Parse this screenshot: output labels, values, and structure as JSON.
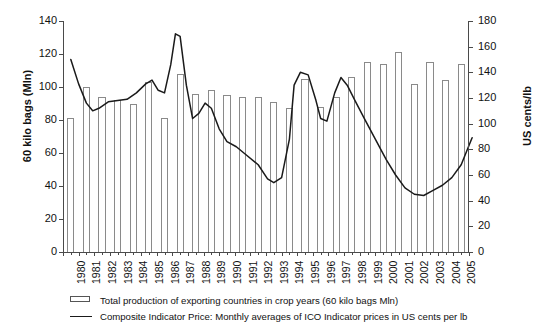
{
  "chart_data": {
    "type": "bar",
    "title": "",
    "xlabel": "",
    "ylabel": "60 kilo bags (Mln)",
    "ylabel_right": "US cents/lb",
    "ylim": [
      0,
      140
    ],
    "ylim_right": [
      0,
      180
    ],
    "yticks": [
      0,
      20,
      40,
      60,
      80,
      100,
      120,
      140
    ],
    "yticks_right": [
      0,
      20,
      40,
      60,
      80,
      100,
      120,
      140,
      160,
      180
    ],
    "grid": false,
    "legend_position": "bottom",
    "categories": [
      "1980",
      "1981",
      "1982",
      "1983",
      "1984",
      "1985",
      "1986",
      "1987",
      "1988",
      "1989",
      "1990",
      "1991",
      "1992",
      "1993",
      "1994",
      "1995",
      "1996",
      "1997",
      "1998",
      "1999",
      "2000",
      "2001",
      "2002",
      "2003",
      "2004",
      "2005"
    ],
    "series": [
      {
        "name": "Total production of exporting countries in crop years (60 kilo bags Mln)",
        "type": "bar",
        "axis": "left",
        "unit": "60 kilo bags Mln",
        "values": [
          81,
          100,
          94,
          92,
          90,
          103,
          81,
          108,
          96,
          98,
          95,
          94,
          94,
          91,
          87,
          105,
          88,
          94,
          106,
          115,
          114,
          121,
          102,
          115,
          104,
          114
        ]
      },
      {
        "name": "Composite Indicator Price: Monthly averages of ICO Indicator prices in US cents per lb",
        "type": "line",
        "axis": "right",
        "unit": "US cents/lb",
        "values": [
          150,
          115,
          112,
          118,
          125,
          131,
          170,
          102,
          110,
          106,
          84,
          76,
          54,
          62,
          137,
          136,
          104,
          133,
          109,
          86,
          64,
          46,
          44,
          51,
          62,
          89
        ]
      }
    ],
    "line_points_right_axis": [
      {
        "x": 1980.0,
        "y": 150
      },
      {
        "x": 1980.5,
        "y": 131
      },
      {
        "x": 1981.0,
        "y": 116
      },
      {
        "x": 1981.4,
        "y": 110
      },
      {
        "x": 1981.8,
        "y": 112
      },
      {
        "x": 1982.4,
        "y": 117
      },
      {
        "x": 1983.0,
        "y": 118
      },
      {
        "x": 1983.6,
        "y": 119
      },
      {
        "x": 1984.2,
        "y": 124
      },
      {
        "x": 1984.8,
        "y": 131
      },
      {
        "x": 1985.2,
        "y": 134
      },
      {
        "x": 1985.6,
        "y": 126
      },
      {
        "x": 1986.0,
        "y": 124
      },
      {
        "x": 1986.4,
        "y": 146
      },
      {
        "x": 1986.7,
        "y": 170
      },
      {
        "x": 1987.0,
        "y": 168
      },
      {
        "x": 1987.4,
        "y": 130
      },
      {
        "x": 1987.8,
        "y": 104
      },
      {
        "x": 1988.2,
        "y": 108
      },
      {
        "x": 1988.6,
        "y": 116
      },
      {
        "x": 1989.0,
        "y": 112
      },
      {
        "x": 1989.5,
        "y": 96
      },
      {
        "x": 1990.0,
        "y": 86
      },
      {
        "x": 1990.6,
        "y": 82
      },
      {
        "x": 1991.2,
        "y": 76
      },
      {
        "x": 1992.0,
        "y": 68
      },
      {
        "x": 1992.6,
        "y": 57
      },
      {
        "x": 1993.0,
        "y": 54
      },
      {
        "x": 1993.5,
        "y": 58
      },
      {
        "x": 1994.0,
        "y": 88
      },
      {
        "x": 1994.3,
        "y": 130
      },
      {
        "x": 1994.7,
        "y": 140
      },
      {
        "x": 1995.2,
        "y": 138
      },
      {
        "x": 1995.7,
        "y": 118
      },
      {
        "x": 1996.0,
        "y": 104
      },
      {
        "x": 1996.4,
        "y": 102
      },
      {
        "x": 1996.9,
        "y": 124
      },
      {
        "x": 1997.3,
        "y": 136
      },
      {
        "x": 1997.7,
        "y": 130
      },
      {
        "x": 1998.2,
        "y": 118
      },
      {
        "x": 1998.8,
        "y": 104
      },
      {
        "x": 1999.5,
        "y": 88
      },
      {
        "x": 2000.2,
        "y": 72
      },
      {
        "x": 2000.8,
        "y": 60
      },
      {
        "x": 2001.4,
        "y": 50
      },
      {
        "x": 2002.0,
        "y": 45
      },
      {
        "x": 2002.6,
        "y": 44
      },
      {
        "x": 2003.2,
        "y": 48
      },
      {
        "x": 2003.8,
        "y": 52
      },
      {
        "x": 2004.4,
        "y": 58
      },
      {
        "x": 2005.0,
        "y": 68
      },
      {
        "x": 2005.4,
        "y": 80
      },
      {
        "x": 2005.7,
        "y": 89
      }
    ],
    "legend": [
      {
        "marker": "bar",
        "label": "Total production of exporting countries in crop years (60 kilo bags Mln)"
      },
      {
        "marker": "line",
        "label": "Composite Indicator Price: Monthly averages of ICO Indicator prices in US cents per lb"
      }
    ]
  }
}
